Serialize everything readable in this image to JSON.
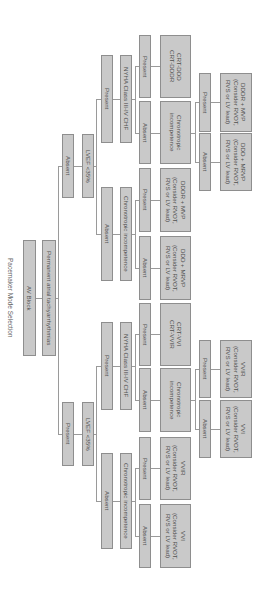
{
  "title": "Pacemaker Mode Selection",
  "root": {
    "label": "AV Block"
  },
  "level1": {
    "label": "Permanent atrial tachyarrhythmias"
  },
  "right_branch": {
    "answer": "Absent",
    "question": "LVEF <35%",
    "yes": {
      "answer": "Present",
      "question": "NYHA Class III-IV CHF",
      "yes": {
        "answer": "Present",
        "result": "CRT-DDD\nCRT-DDDR"
      },
      "no": {
        "answer": "Absent",
        "question": "Chronotropic\nincompetence",
        "yes": {
          "answer": "Present",
          "result": "DDDR + MVP\n(Consider RVOT,\nRVS or LV lead)"
        },
        "no": {
          "answer": "Absent",
          "result": "DDD + MRVP\n(Consider RVOT,\nRVS or LV lead)"
        }
      }
    },
    "no": {
      "answer": "Absent",
      "question": "Chronotropic incompetence",
      "yes": {
        "answer": "Present",
        "result": "DDDR + MVP\n(Consider RVOT,\nRVS or LV lead)"
      },
      "no": {
        "answer": "Absent",
        "result": "DDD + MRVP\n(Consider RVOT,\nRVS or LV lead)"
      }
    }
  },
  "left_branch": {
    "answer": "Present",
    "question": "LVEF <35%",
    "yes": {
      "answer": "Present",
      "question": "NYHA Class III-IV CHF",
      "yes": {
        "answer": "Present",
        "result": "CRT-VVI\nCRT-VVIR"
      },
      "no": {
        "answer": "Absent",
        "question": "Chronotropic\nincompetence",
        "yes": {
          "answer": "Present",
          "result": "VVIR\n(Consider RVOT,\nRVS or LV lead)"
        },
        "no": {
          "answer": "Absent",
          "result": "VVI\n(Consider RVOT,\nRVS or LV lead)"
        }
      }
    },
    "no": {
      "answer": "Absent",
      "question": "Chronotropic incompetence",
      "yes": {
        "answer": "Present",
        "result": "VVIR\n(Consider RVOT,\nRVS or LV lead)"
      },
      "no": {
        "answer": "Absent",
        "result": "VVI\n(Consider RVOT,\nRVS or LV lead)"
      }
    }
  },
  "colors": {
    "box_fill": "#c9c9c9",
    "box_border": "#8e8e8e",
    "text": "#4f4f4f",
    "line": "#9a9a9a"
  }
}
